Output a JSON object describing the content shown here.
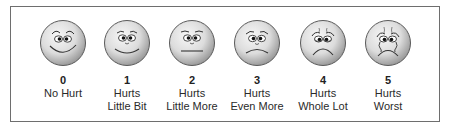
{
  "colors": {
    "border": "#6e6e6e",
    "face_fill_light": "#f4f4f4",
    "face_fill_dark": "#a9a9a9",
    "face_stroke": "#555555",
    "feature": "#2a2a2a"
  },
  "faces": [
    {
      "number": "0",
      "line1": "No Hurt",
      "line2": "",
      "expression": "very-happy"
    },
    {
      "number": "1",
      "line1": "Hurts",
      "line2": "Little Bit",
      "expression": "happy"
    },
    {
      "number": "2",
      "line1": "Hurts",
      "line2": "Little More",
      "expression": "neutral"
    },
    {
      "number": "3",
      "line1": "Hurts",
      "line2": "Even More",
      "expression": "slightly-sad"
    },
    {
      "number": "4",
      "line1": "Hurts",
      "line2": "Whole Lot",
      "expression": "sad"
    },
    {
      "number": "5",
      "line1": "Hurts",
      "line2": "Worst",
      "expression": "crying"
    }
  ]
}
